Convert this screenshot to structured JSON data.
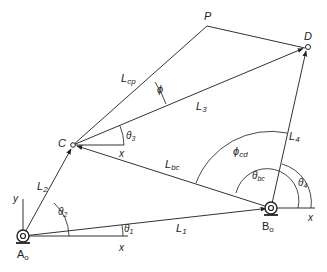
{
  "diagram": {
    "points": {
      "A0": {
        "label": "A",
        "sub": "o",
        "x": 23,
        "y": 236
      },
      "B0": {
        "label": "B",
        "sub": "o",
        "x": 271,
        "y": 208
      },
      "C": {
        "label": "C",
        "x": 73,
        "y": 145
      },
      "D": {
        "label": "D",
        "x": 307,
        "y": 47
      },
      "P": {
        "label": "P",
        "x": 207,
        "y": 26
      }
    },
    "links": {
      "L1": {
        "label": "L",
        "sub": "1"
      },
      "L2": {
        "label": "L",
        "sub": "2"
      },
      "L3": {
        "label": "L",
        "sub": "3"
      },
      "L4": {
        "label": "L",
        "sub": "4"
      },
      "Lbc": {
        "label": "L",
        "sub": "bc"
      },
      "Lcp": {
        "label": "L",
        "sub": "cp"
      }
    },
    "angles": {
      "theta1": {
        "label": "θ",
        "sub": "1"
      },
      "theta2": {
        "label": "θ",
        "sub": "2"
      },
      "theta3": {
        "label": "θ",
        "sub": "3"
      },
      "theta4": {
        "label": "θ",
        "sub": "4"
      },
      "theta_bc": {
        "label": "θ",
        "sub": "bc"
      },
      "phi": {
        "label": "ϕ"
      },
      "phi_cd": {
        "label": "ϕ",
        "sub": "cd"
      }
    },
    "axes": {
      "x_label": "x",
      "y_label": "y"
    }
  }
}
